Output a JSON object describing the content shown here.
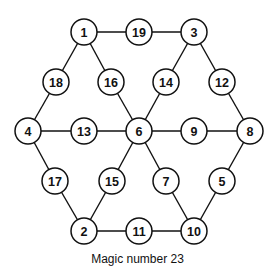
{
  "title": "Magic number 23",
  "colors": {
    "stroke": "#111111",
    "fill": "#ffffff",
    "text": "#111111"
  },
  "node_radius": 13,
  "nodes": [
    {
      "id": "n1",
      "label": "1",
      "x": 84,
      "y": 32
    },
    {
      "id": "n19",
      "label": "19",
      "x": 139,
      "y": 32
    },
    {
      "id": "n3",
      "label": "3",
      "x": 194,
      "y": 32
    },
    {
      "id": "n18",
      "label": "18",
      "x": 56,
      "y": 82
    },
    {
      "id": "n16",
      "label": "16",
      "x": 111,
      "y": 82
    },
    {
      "id": "n14",
      "label": "14",
      "x": 166,
      "y": 82
    },
    {
      "id": "n12",
      "label": "12",
      "x": 222,
      "y": 82
    },
    {
      "id": "n4",
      "label": "4",
      "x": 28,
      "y": 131
    },
    {
      "id": "n13",
      "label": "13",
      "x": 84,
      "y": 131
    },
    {
      "id": "n6",
      "label": "6",
      "x": 139,
      "y": 131
    },
    {
      "id": "n9",
      "label": "9",
      "x": 194,
      "y": 131
    },
    {
      "id": "n8",
      "label": "8",
      "x": 250,
      "y": 131
    },
    {
      "id": "n17",
      "label": "17",
      "x": 55,
      "y": 181
    },
    {
      "id": "n15",
      "label": "15",
      "x": 112,
      "y": 181
    },
    {
      "id": "n7",
      "label": "7",
      "x": 166,
      "y": 181
    },
    {
      "id": "n5",
      "label": "5",
      "x": 222,
      "y": 181
    },
    {
      "id": "n2",
      "label": "2",
      "x": 84,
      "y": 231
    },
    {
      "id": "n11",
      "label": "11",
      "x": 139,
      "y": 231
    },
    {
      "id": "n10",
      "label": "10",
      "x": 194,
      "y": 231
    }
  ],
  "edges": [
    [
      "n1",
      "n19"
    ],
    [
      "n19",
      "n3"
    ],
    [
      "n1",
      "n18"
    ],
    [
      "n18",
      "n4"
    ],
    [
      "n1",
      "n16"
    ],
    [
      "n16",
      "n6"
    ],
    [
      "n3",
      "n14"
    ],
    [
      "n14",
      "n6"
    ],
    [
      "n3",
      "n12"
    ],
    [
      "n12",
      "n8"
    ],
    [
      "n4",
      "n13"
    ],
    [
      "n13",
      "n6"
    ],
    [
      "n6",
      "n9"
    ],
    [
      "n9",
      "n8"
    ],
    [
      "n4",
      "n17"
    ],
    [
      "n17",
      "n2"
    ],
    [
      "n6",
      "n15"
    ],
    [
      "n15",
      "n2"
    ],
    [
      "n6",
      "n7"
    ],
    [
      "n7",
      "n10"
    ],
    [
      "n8",
      "n5"
    ],
    [
      "n5",
      "n10"
    ],
    [
      "n2",
      "n11"
    ],
    [
      "n11",
      "n10"
    ]
  ],
  "lines_sum_to": 23
}
